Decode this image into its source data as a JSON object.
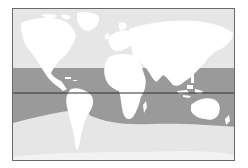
{
  "map": {
    "type": "world-map",
    "projection": "equirectangular",
    "highlighted_region": "tropical-band",
    "reference_line": "equator",
    "colors": {
      "ocean": "#e6e6e6",
      "land": "#ffffff",
      "band": "#9a9a9a",
      "band_land": "#ffffff",
      "equator": "#2e2e2e",
      "frame": "#6a6a6a"
    }
  }
}
